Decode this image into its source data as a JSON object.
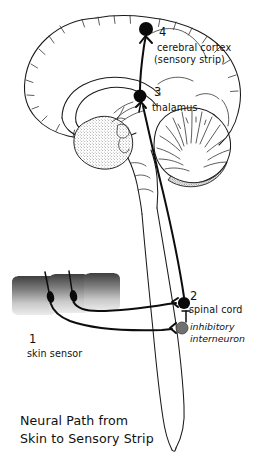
{
  "figure": {
    "title_line1": "Neural Path from",
    "title_line2": "Skin to Sensory Strip",
    "background_color": "#ffffff",
    "ink_color": "#111111"
  },
  "labels": {
    "step1": {
      "number": "1",
      "text": "skin sensor"
    },
    "step2": {
      "number": "2",
      "text": "spinal cord"
    },
    "interneuron": {
      "text_line1": "inhibitory",
      "text_line2": "interneuron"
    },
    "step3": {
      "number": "3",
      "text": "thalamus"
    },
    "step4": {
      "number": "4",
      "text_line1": "cerebral cortex",
      "text_line2": "(sensory strip)"
    }
  },
  "nodes": [
    {
      "id": "skin-sensor",
      "number": "1",
      "label": "skin sensor",
      "x": 60,
      "y": 296,
      "fill": "#0a0a0a"
    },
    {
      "id": "spinal-cord-neuron",
      "number": "2",
      "label": "spinal cord",
      "x": 184,
      "y": 303,
      "fill": "#0a0a0a"
    },
    {
      "id": "inhibitory-interneuron",
      "number": "",
      "label": "inhibitory interneuron",
      "x": 182,
      "y": 328,
      "fill": "#707070"
    },
    {
      "id": "thalamus-neuron",
      "number": "3",
      "label": "thalamus",
      "x": 140,
      "y": 96,
      "fill": "#0a0a0a"
    },
    {
      "id": "cortex-neuron",
      "number": "4",
      "label": "cerebral cortex (sensory strip)",
      "x": 146,
      "y": 29,
      "fill": "#0a0a0a"
    }
  ],
  "structures": [
    {
      "id": "cerebral-cortex",
      "label": "cerebral cortex"
    },
    {
      "id": "corpus-callosum",
      "label": "corpus callosum"
    },
    {
      "id": "cerebellum",
      "label": "cerebellum"
    },
    {
      "id": "brainstem",
      "label": "brainstem"
    },
    {
      "id": "spinal-cord",
      "label": "spinal cord"
    },
    {
      "id": "skin-block",
      "label": "skin block"
    }
  ],
  "colors": {
    "node_dark": "#0a0a0a",
    "node_gray": "#707070",
    "outline": "#1a1a1a",
    "skin_gradient_dark": "#3a3a3a",
    "skin_gradient_light": "#e8e8e8"
  }
}
